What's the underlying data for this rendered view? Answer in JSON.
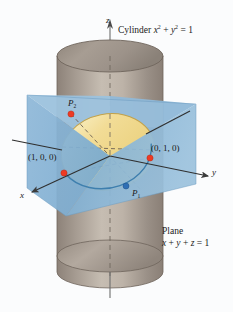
{
  "figure": {
    "background_color": "#fbfcfd",
    "width": 233,
    "height": 312
  },
  "labels": {
    "cylinder": {
      "prefix": "Cylinder ",
      "var1": "x",
      "exp1": "2",
      "plus": " + ",
      "var2": "y",
      "exp2": "2",
      "equals": " = 1"
    },
    "plane": {
      "title": "Plane",
      "equation_x": "x",
      "equation_plus1": " + ",
      "equation_y": "y",
      "equation_plus2": " + ",
      "equation_z": "z",
      "equation_eq": " = 1"
    },
    "axis_z": "z",
    "axis_y": "y",
    "axis_x": "x",
    "point_p2": {
      "base": "P",
      "sub": "2"
    },
    "point_p1": {
      "base": "P",
      "sub": "1"
    },
    "point_100": "(1, 0, 0)",
    "point_010": "(0, 1, 0)"
  },
  "colors": {
    "plane_fill": "#7fb0d4",
    "plane_fill_light": "#a9cbe2",
    "ellipse_fill": "#f0d88a",
    "ellipse_fill_light": "#f7e9bc",
    "ellipse_stroke": "#c9a94f",
    "cylinder_body": "#9c9188",
    "cylinder_body_light": "#c8bfb4",
    "cylinder_top": "#9a8f83",
    "marker_red": "#ee3a24",
    "marker_blue": "#2f6fb5",
    "axis_line": "#3b3b3b",
    "dashed_line": "#5a5349",
    "text": "#1a1a1a"
  },
  "geometry": {
    "center": {
      "x": 110,
      "y": 156
    },
    "cylinder": {
      "cx": 110,
      "rx": 53,
      "top_y": 56,
      "bottom_y": 272,
      "cap_ry": 16
    },
    "ellipse_cut": {
      "cx": 108,
      "cy": 152,
      "rx": 47,
      "ry": 38,
      "rotation_deg": -12
    },
    "markers": [
      {
        "name": "point-1-0-0",
        "x": 64,
        "y": 173,
        "color": "red"
      },
      {
        "name": "point-0-1-0",
        "x": 150,
        "y": 158,
        "color": "red"
      },
      {
        "name": "point-p2",
        "x": 71,
        "y": 114,
        "color": "red"
      },
      {
        "name": "point-p1",
        "x": 126,
        "y": 186,
        "color": "blue"
      }
    ]
  }
}
